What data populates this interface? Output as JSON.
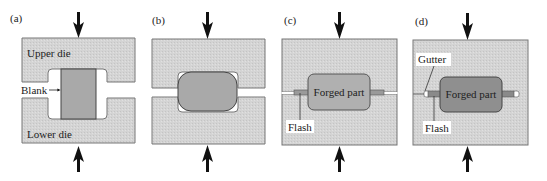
{
  "panels": [
    {
      "id": "a",
      "label": "(a)",
      "upper_die": "Upper die",
      "lower_die": "Lower die",
      "blank": "Blank"
    },
    {
      "id": "b",
      "label": "(b)"
    },
    {
      "id": "c",
      "label": "(c)",
      "part": "Forged part",
      "flash": "Flash"
    },
    {
      "id": "d",
      "label": "(d)",
      "part": "Forged part",
      "flash": "Flash",
      "gutter": "Gutter"
    }
  ],
  "colors": {
    "die": "#d6d6d6",
    "die_edge": "#777777",
    "blank": "#a9a9a9",
    "part_c": "#b0b0b0",
    "part_d": "#8f8f8f",
    "arrow": "#111111"
  }
}
